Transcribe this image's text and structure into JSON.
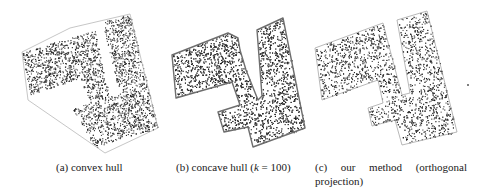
{
  "figure": {
    "subfigures": [
      {
        "id": "a",
        "label": "(a)",
        "caption": "convex hull",
        "outline_color": "#b8b8b8",
        "hull_polygon": [
          [
            22,
            52
          ],
          [
            70,
            28
          ],
          [
            130,
            14
          ],
          [
            158,
            128
          ],
          [
            105,
            153
          ],
          [
            28,
            100
          ]
        ],
        "mask_rects": [
          {
            "note": "left arm",
            "poly": [
              [
                22,
                52
              ],
              [
                95,
                30
              ],
              [
                103,
                70
              ],
              [
                30,
                95
              ]
            ]
          },
          {
            "note": "right bar",
            "poly": [
              [
                102,
                22
              ],
              [
                130,
                14
              ],
              [
                158,
                128
              ],
              [
                130,
                136
              ]
            ]
          },
          {
            "note": "stem",
            "poly": [
              [
                70,
                42
              ],
              [
                92,
                35
              ],
              [
                118,
                120
              ],
              [
                96,
                128
              ]
            ]
          },
          {
            "note": "lower block",
            "poly": [
              [
                72,
                108
              ],
              [
                130,
                90
              ],
              [
                140,
                130
              ],
              [
                95,
                148
              ]
            ]
          }
        ]
      },
      {
        "id": "b",
        "label": "(b)",
        "caption_prefix": "concave hull (",
        "caption_var": "k",
        "caption_suffix": " = 100)",
        "outline_color": "#6e6e6e",
        "hull_polygon": [
          [
            172,
            55
          ],
          [
            228,
            33
          ],
          [
            238,
            38
          ],
          [
            240,
            50
          ],
          [
            246,
            70
          ],
          [
            258,
            100
          ],
          [
            262,
            96
          ],
          [
            257,
            30
          ],
          [
            283,
            18
          ],
          [
            305,
            128
          ],
          [
            253,
            147
          ],
          [
            248,
            127
          ],
          [
            224,
            132
          ],
          [
            218,
            112
          ],
          [
            240,
            105
          ],
          [
            232,
            82
          ],
          [
            176,
            98
          ]
        ]
      },
      {
        "id": "c",
        "label": "(c)",
        "caption_line1": [
          "our",
          "method",
          "(orthogonal"
        ],
        "caption_line2": "projection)",
        "outline_color": "#9a9a9a",
        "hull_polygon": [
          [
            315,
            48
          ],
          [
            383,
            23
          ],
          [
            390,
            50
          ],
          [
            402,
            95
          ],
          [
            410,
            93
          ],
          [
            397,
            20
          ],
          [
            427,
            11
          ],
          [
            457,
            132
          ],
          [
            402,
            145
          ],
          [
            395,
            120
          ],
          [
            372,
            126
          ],
          [
            368,
            108
          ],
          [
            383,
            103
          ],
          [
            378,
            80
          ],
          [
            322,
            100
          ]
        ]
      }
    ],
    "stray_dot": {
      "x": 467,
      "y": 84
    }
  }
}
